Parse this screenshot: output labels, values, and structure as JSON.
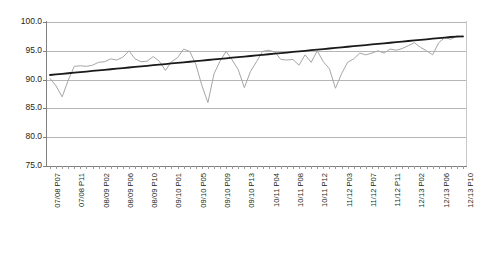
{
  "chart_data": {
    "type": "line",
    "title": "",
    "subtitle": "",
    "xlabel": "",
    "ylabel": "",
    "ylim": [
      75.0,
      100.0
    ],
    "yticks": [
      100.0,
      95.0,
      90.0,
      85.0,
      80.0,
      75.0
    ],
    "ytick_labels": [
      "100.0",
      "95.0",
      "90.0",
      "85.0",
      "80.0",
      "75.0"
    ],
    "grid": true,
    "legend": "none",
    "xtick_labels": [
      "07/08 P07",
      "07/08 P11",
      "08/09 P02",
      "08/09 P06",
      "08/09 P10",
      "09/10 P01",
      "09/10 P05",
      "09/10 P09",
      "09/10 P13",
      "10/11 P04",
      "10/11 P08",
      "10/11 P12",
      "11/12 P03",
      "11/12 P07",
      "11/12 P11",
      "12/13 P02",
      "12/13 P06",
      "12/13 P10"
    ],
    "x": [
      "07/08 P07",
      "07/08 P08",
      "07/08 P09",
      "07/08 P10",
      "07/08 P11",
      "07/08 P12",
      "07/08 P13",
      "08/09 P01",
      "08/09 P02",
      "08/09 P03",
      "08/09 P04",
      "08/09 P05",
      "08/09 P06",
      "08/09 P07",
      "08/09 P08",
      "08/09 P09",
      "08/09 P10",
      "08/09 P11",
      "08/09 P12",
      "08/09 P13",
      "09/10 P01",
      "09/10 P02",
      "09/10 P03",
      "09/10 P04",
      "09/10 P05",
      "09/10 P06",
      "09/10 P07",
      "09/10 P08",
      "09/10 P09",
      "09/10 P10",
      "09/10 P11",
      "09/10 P12",
      "09/10 P13",
      "10/11 P01",
      "10/11 P02",
      "10/11 P03",
      "10/11 P04",
      "10/11 P05",
      "10/11 P06",
      "10/11 P07",
      "10/11 P08",
      "10/11 P09",
      "10/11 P10",
      "10/11 P11",
      "10/11 P12",
      "10/11 P13",
      "11/12 P01",
      "11/12 P02",
      "11/12 P03",
      "11/12 P04",
      "11/12 P05",
      "11/12 P06",
      "11/12 P07",
      "11/12 P08",
      "11/12 P09",
      "11/12 P10",
      "11/12 P11",
      "11/12 P12",
      "11/12 P13",
      "12/13 P01",
      "12/13 P02",
      "12/13 P03",
      "12/13 P04",
      "12/13 P05",
      "12/13 P06",
      "12/13 P07",
      "12/13 P08",
      "12/13 P09",
      "12/13 P10"
    ],
    "series": [
      {
        "name": "Performance",
        "color": "#a6a6a6",
        "values": [
          90.2,
          88.9,
          87.0,
          89.9,
          92.3,
          92.4,
          92.3,
          92.5,
          93.0,
          93.1,
          93.6,
          93.4,
          93.9,
          95.0,
          93.6,
          93.1,
          93.2,
          94.0,
          93.2,
          91.6,
          93.1,
          93.8,
          95.3,
          94.9,
          92.7,
          89.0,
          86.0,
          91.0,
          93.2,
          94.9,
          93.4,
          91.7,
          88.6,
          91.4,
          93.1,
          94.9,
          95.1,
          94.8,
          93.5,
          93.4,
          93.5,
          92.5,
          94.3,
          93.0,
          95.0,
          93.1,
          91.9,
          88.5,
          91.0,
          93.0,
          93.6,
          94.6,
          94.3,
          94.6,
          95.0,
          94.6,
          95.3,
          95.1,
          95.4,
          95.9,
          96.4,
          95.6,
          95.0,
          94.3,
          96.4,
          97.3,
          97.0,
          97.6,
          97.4
        ]
      },
      {
        "name": "Linear trend",
        "color": "#1a1a1a",
        "values": [
          90.8,
          90.9,
          91.0,
          91.1,
          91.2,
          91.3,
          91.4,
          91.5,
          91.6,
          91.7,
          91.8,
          91.9,
          92.0,
          92.1,
          92.2,
          92.3,
          92.4,
          92.5,
          92.6,
          92.7,
          92.8,
          92.9,
          93.0,
          93.1,
          93.2,
          93.3,
          93.4,
          93.5,
          93.6,
          93.7,
          93.8,
          93.9,
          94.0,
          94.1,
          94.2,
          94.3,
          94.4,
          94.5,
          94.6,
          94.7,
          94.8,
          94.9,
          95.0,
          95.1,
          95.2,
          95.3,
          95.4,
          95.5,
          95.6,
          95.7,
          95.8,
          95.9,
          96.0,
          96.1,
          96.2,
          96.3,
          96.4,
          96.5,
          96.6,
          96.7,
          96.8,
          96.9,
          97.0,
          97.1,
          97.2,
          97.3,
          97.4,
          97.45,
          97.5
        ]
      }
    ]
  }
}
